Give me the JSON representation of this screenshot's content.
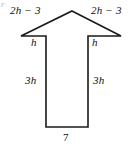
{
  "figure": {
    "type": "geometry-diagram",
    "shape_name": "arrow-polygon",
    "stroke_color": "#1a1a1a",
    "fill_color": "#ffffff",
    "background_color": "#ffffff",
    "corner_artifact": "r",
    "labels": {
      "arrowhead_left": "2h − 3",
      "arrowhead_right": "2h − 3",
      "barb_left": "h",
      "barb_right": "h",
      "shaft_left": "3h",
      "shaft_right": "3h",
      "base": "7"
    },
    "vertices": {
      "apex": [
        72,
        11
      ],
      "wing_tip_left": [
        21,
        36
      ],
      "barb_top_left": [
        46,
        33
      ],
      "barb_bottom_left": [
        46,
        44
      ],
      "shaft_bottom_left": [
        46,
        127
      ],
      "shaft_bottom_right": [
        88,
        127
      ],
      "barb_bottom_right": [
        88,
        44
      ],
      "barb_top_right": [
        88,
        33
      ],
      "wing_tip_right": [
        121,
        36
      ]
    }
  }
}
